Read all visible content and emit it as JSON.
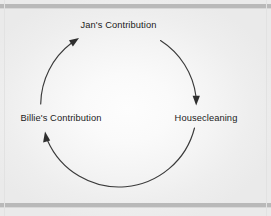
{
  "figure": {
    "type": "cycle-diagram",
    "background_color": "#f4f4f4",
    "rule_color": "#b9b9b9",
    "stroke_color": "#3a3a3a",
    "text_color": "#1b1b1b"
  },
  "nodes": [
    {
      "id": "jans-contribution",
      "label": "Jan's Contribution",
      "position": "top"
    },
    {
      "id": "housecleaning",
      "label": "Housecleaning",
      "position": "right"
    },
    {
      "id": "billies-contribution",
      "label": "Billie's Contribution",
      "position": "left"
    }
  ],
  "arrows": [
    {
      "id": "jans-to-housecleaning",
      "from": "jans-contribution",
      "to": "housecleaning",
      "direction": "down",
      "side": "right"
    },
    {
      "id": "housecleaning-to-billies",
      "from": "housecleaning",
      "to": "billies-contribution",
      "direction": "up",
      "side": "bottom-left"
    },
    {
      "id": "billies-to-jans",
      "from": "billies-contribution",
      "to": "jans-contribution",
      "direction": "up-right",
      "side": "upper-left"
    }
  ]
}
